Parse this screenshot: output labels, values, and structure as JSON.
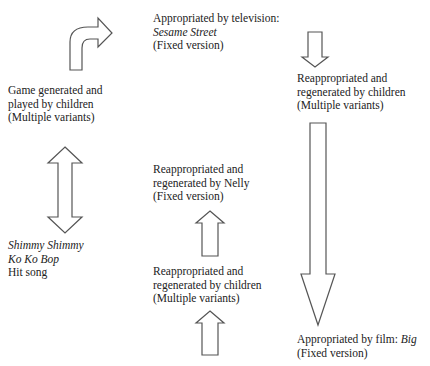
{
  "diagram": {
    "nodes": [
      {
        "id": "game",
        "lines": [
          "Game generated and",
          "played by children",
          "(Multiple variants)"
        ]
      },
      {
        "id": "television",
        "lines": [
          "Appropriated by television:",
          "Sesame Street",
          "(Fixed version)"
        ],
        "italic_line": 1
      },
      {
        "id": "children_reapp_1",
        "lines": [
          "Reappropriated and",
          "regenerated by children",
          "(Multiple variants)"
        ]
      },
      {
        "id": "nelly",
        "lines": [
          "Reappropriated and",
          "regenerated by Nelly",
          "(Fixed version)"
        ]
      },
      {
        "id": "children_reapp_2",
        "lines": [
          "Reappropriated and",
          "regenerated by children",
          "(Multiple variants)"
        ]
      },
      {
        "id": "song",
        "lines": [
          "Shimmy Shimmy",
          "Ko Ko Bop",
          "Hit song"
        ],
        "italic_lines": [
          0,
          1
        ]
      },
      {
        "id": "film",
        "lines": [
          "Appropriated by film: ",
          "Big",
          "(Fixed version)"
        ]
      }
    ],
    "edges": [
      {
        "from": "game",
        "to": "television",
        "shape": "curved-arrow"
      },
      {
        "from": "television",
        "to": "children_reapp_1",
        "shape": "down-arrow"
      },
      {
        "from": "children_reapp_1",
        "to": "film",
        "shape": "long-down-arrow"
      },
      {
        "from": "children_reapp_2",
        "to": "nelly",
        "shape": "up-arrow"
      },
      {
        "from": "song",
        "to": "children_reapp_2",
        "shape": "up-arrow"
      },
      {
        "from": "game",
        "to": "song",
        "shape": "double-arrow"
      }
    ]
  }
}
